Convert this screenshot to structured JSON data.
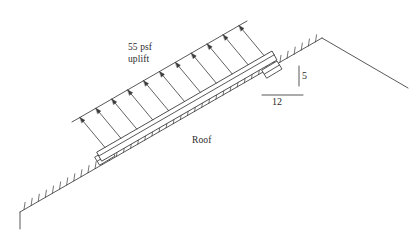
{
  "figure": {
    "background_color": "#ffffff",
    "line_color": "#3a3a3a",
    "text_color": "#2b2b2b"
  },
  "labels": {
    "load_line1": "55 psf",
    "load_line2": "uplift",
    "roof": "Roof",
    "slope_rise": "5",
    "slope_run": "12"
  },
  "chart_data": {
    "type": "diagram",
    "annotations": [
      {
        "name": "distributed-load",
        "text": "55 psf uplift",
        "magnitude": 55,
        "units": "psf",
        "direction": "uplift (perpendicular to roof, away from surface)"
      },
      {
        "name": "roof-surface",
        "text": "Roof"
      },
      {
        "name": "slope-rise",
        "text": "5",
        "value": 5
      },
      {
        "name": "slope-run",
        "text": "12",
        "value": 12
      }
    ],
    "slope": {
      "rise": 5,
      "run": 12,
      "ratio_text": "5:12"
    },
    "load_arrow_count": 11,
    "supports": 2,
    "legend": "none",
    "grid": false
  }
}
